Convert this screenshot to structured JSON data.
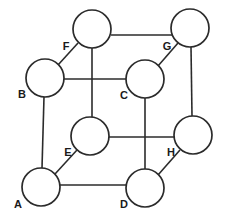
{
  "diagram": {
    "type": "node-link-diagram",
    "background_color": "#ffffff",
    "stroke_color": "#2b2b2b",
    "fill_color": "#ffffff",
    "label_color": "#1a1a1a",
    "canvas": {
      "width": 227,
      "height": 219
    },
    "vertex_radius": 19,
    "vertices": [
      {
        "id": "A",
        "label": "A",
        "cx": 41,
        "cy": 187,
        "r": 19,
        "label_x": 18,
        "label_y": 205
      },
      {
        "id": "B",
        "label": "B",
        "cx": 45,
        "cy": 78,
        "r": 19,
        "label_x": 22,
        "label_y": 95
      },
      {
        "id": "C",
        "label": "C",
        "cx": 145,
        "cy": 79,
        "r": 19,
        "label_x": 124,
        "label_y": 96
      },
      {
        "id": "D",
        "label": "D",
        "cx": 145,
        "cy": 188,
        "r": 19,
        "label_x": 124,
        "label_y": 205
      },
      {
        "id": "E",
        "label": "E",
        "cx": 90,
        "cy": 136,
        "r": 19,
        "label_x": 68,
        "label_y": 153
      },
      {
        "id": "F",
        "label": "F",
        "cx": 92,
        "cy": 29,
        "r": 19,
        "label_x": 66,
        "label_y": 47
      },
      {
        "id": "G",
        "label": "G",
        "cx": 190,
        "cy": 28,
        "r": 19,
        "label_x": 167,
        "label_y": 47
      },
      {
        "id": "H",
        "label": "H",
        "cx": 193,
        "cy": 135,
        "r": 19,
        "label_x": 171,
        "label_y": 153
      }
    ],
    "edges": [
      {
        "id": "edge-F-G",
        "from": "F",
        "to": "G",
        "kind": "horizontal",
        "x1": 111,
        "y1": 35,
        "x2": 172,
        "y2": 35
      },
      {
        "id": "edge-B-C",
        "from": "B",
        "to": "C",
        "kind": "horizontal",
        "x1": 64,
        "y1": 79,
        "x2": 126,
        "y2": 79
      },
      {
        "id": "edge-E-H",
        "from": "E",
        "to": "H",
        "kind": "horizontal",
        "x1": 109,
        "y1": 137,
        "x2": 174,
        "y2": 137
      },
      {
        "id": "edge-A-D",
        "from": "A",
        "to": "D",
        "kind": "horizontal",
        "x1": 60,
        "y1": 185,
        "x2": 126,
        "y2": 185
      },
      {
        "id": "edge-F-E",
        "from": "F",
        "to": "E",
        "kind": "vertical",
        "x1": 92,
        "y1": 48,
        "x2": 92,
        "y2": 118
      },
      {
        "id": "edge-C-D",
        "from": "C",
        "to": "D",
        "kind": "vertical",
        "x1": 145,
        "y1": 98,
        "x2": 145,
        "y2": 169
      },
      {
        "id": "edge-B-A",
        "from": "B",
        "to": "A",
        "kind": "vertical",
        "x1": 44,
        "y1": 97,
        "x2": 42,
        "y2": 168
      },
      {
        "id": "edge-G-H",
        "from": "G",
        "to": "H",
        "kind": "vertical",
        "x1": 191,
        "y1": 47,
        "x2": 192,
        "y2": 116
      },
      {
        "id": "edge-B-F",
        "from": "B",
        "to": "F",
        "kind": "diagonal",
        "x1": 58,
        "y1": 65,
        "x2": 78,
        "y2": 43
      },
      {
        "id": "edge-A-E",
        "from": "A",
        "to": "E",
        "kind": "diagonal",
        "x1": 55,
        "y1": 174,
        "x2": 77,
        "y2": 150
      },
      {
        "id": "edge-C-G",
        "from": "C",
        "to": "G",
        "kind": "diagonal",
        "x1": 158,
        "y1": 66,
        "x2": 178,
        "y2": 43
      },
      {
        "id": "edge-D-H",
        "from": "D",
        "to": "H",
        "kind": "diagonal",
        "x1": 158,
        "y1": 175,
        "x2": 180,
        "y2": 150
      }
    ]
  }
}
